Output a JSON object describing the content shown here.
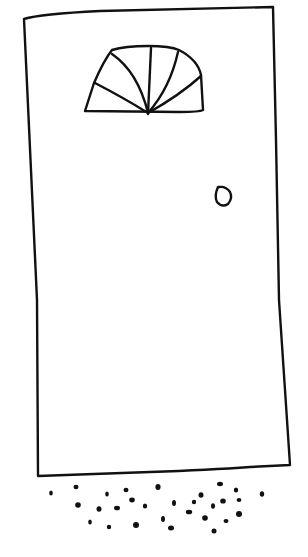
{
  "drawing": {
    "subject": "door sketch",
    "stroke_color": "#111111",
    "background": "#ffffff",
    "parts": [
      "door-frame",
      "fanlight-window",
      "doorknob",
      "gravel"
    ]
  }
}
